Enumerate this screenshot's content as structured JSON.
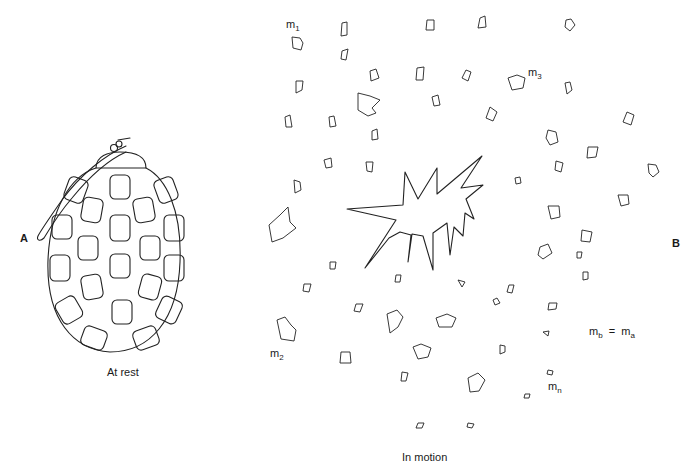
{
  "panel_a": {
    "letter": "A",
    "caption": "At rest",
    "object": "grenade-intact"
  },
  "panel_b": {
    "letter": "B",
    "caption": "In motion",
    "object": "grenade-exploding-fragments",
    "labels": {
      "m1": "m",
      "m1_sub": "1",
      "m2": "m",
      "m2_sub": "2",
      "m3": "m",
      "m3_sub": "3",
      "mn": "m",
      "mn_sub": "n",
      "equation_lhs": "m",
      "equation_lhs_sub": "b",
      "equation_eq": "=",
      "equation_rhs": "m",
      "equation_rhs_sub": "a"
    }
  },
  "colors": {
    "background": "#ffffff",
    "ink": "#222222"
  }
}
